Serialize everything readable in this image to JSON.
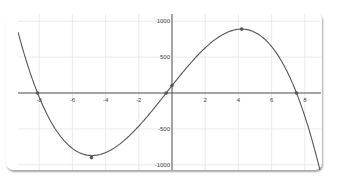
{
  "chart_data": {
    "type": "line",
    "title": "",
    "xlabel": "",
    "ylabel": "",
    "xlim": [
      -9,
      9
    ],
    "ylim": [
      -1100,
      1100
    ],
    "grid": true,
    "x_ticks": [
      -8,
      -6,
      -4,
      -2,
      2,
      4,
      6,
      8
    ],
    "y_ticks": [
      1000,
      500,
      -500,
      -1000
    ],
    "x_tick_labels": [
      "-8",
      "-6",
      "-4",
      "-2",
      "2",
      "4",
      "6",
      "8"
    ],
    "y_tick_labels": [
      "1000",
      "500",
      "-500",
      "-1000"
    ],
    "series": [
      {
        "name": "cubic",
        "function": "f(x) = -4.82 (x + 8.1)(x + 0.35)(x - 7.5)",
        "x": [
          -9,
          -8.1,
          -6,
          -4.85,
          -3,
          -0.35,
          0,
          2,
          4.2,
          6,
          7.5,
          9
        ],
        "y": [
          620,
          0,
          -680,
          -900,
          -760,
          0,
          105,
          620,
          890,
          660,
          0,
          -1020
        ]
      }
    ],
    "points": [
      {
        "label": "root",
        "x": -8.1,
        "y": 0
      },
      {
        "label": "minimum",
        "x": -4.85,
        "y": -900
      },
      {
        "label": "root",
        "x": -0.35,
        "y": 0
      },
      {
        "label": "y-intercept",
        "x": 0,
        "y": 105
      },
      {
        "label": "maximum",
        "x": 4.2,
        "y": 890
      },
      {
        "label": "root",
        "x": 7.5,
        "y": 0
      }
    ],
    "colors": {
      "curve": "#555555",
      "axis": "#555555",
      "grid": "#e6e6e6",
      "point": "#555555"
    }
  }
}
